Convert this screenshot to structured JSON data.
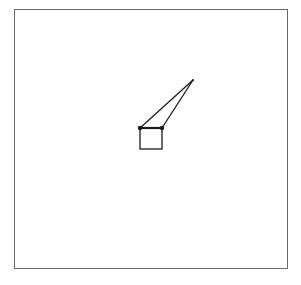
{
  "diagram": {
    "frame": {
      "x": 14,
      "y": 9,
      "width": 274,
      "height": 260,
      "stroke": "#6a6a6a"
    },
    "apex": {
      "x": 193,
      "y": 80
    },
    "joints": [
      {
        "x": 140,
        "y": 128
      },
      {
        "x": 162,
        "y": 128
      }
    ],
    "box": {
      "x": 140,
      "y": 128,
      "width": 22,
      "height": 21
    },
    "stroke_color": "#1a1a1a"
  }
}
